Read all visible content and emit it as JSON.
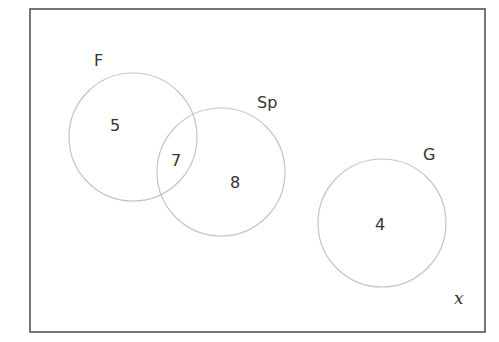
{
  "diagram": {
    "type": "venn",
    "universe": {
      "label": "x",
      "rect": {
        "x": 30,
        "y": 9,
        "width": 455,
        "height": 323
      },
      "label_pos": {
        "x": 454,
        "y": 304
      }
    },
    "sets": [
      {
        "id": "F",
        "label": "F",
        "circle": {
          "cx": 133,
          "cy": 137,
          "r": 64
        },
        "label_pos": {
          "x": 94,
          "y": 66
        }
      },
      {
        "id": "Sp",
        "label": "Sp",
        "circle": {
          "cx": 221,
          "cy": 172,
          "r": 64
        },
        "label_pos": {
          "x": 257,
          "y": 108
        }
      },
      {
        "id": "G",
        "label": "G",
        "circle": {
          "cx": 382,
          "cy": 223,
          "r": 64
        },
        "label_pos": {
          "x": 423,
          "y": 160
        }
      }
    ],
    "regions": [
      {
        "id": "F-only",
        "sets": [
          "F"
        ],
        "count": "5",
        "pos": {
          "x": 110,
          "y": 131
        }
      },
      {
        "id": "F-and-Sp",
        "sets": [
          "F",
          "Sp"
        ],
        "count": "7",
        "pos": {
          "x": 171,
          "y": 166
        }
      },
      {
        "id": "Sp-only",
        "sets": [
          "Sp"
        ],
        "count": "8",
        "pos": {
          "x": 230,
          "y": 188
        }
      },
      {
        "id": "G-only",
        "sets": [
          "G"
        ],
        "count": "4",
        "pos": {
          "x": 375,
          "y": 230
        }
      }
    ]
  },
  "colors": {
    "border": "#555555",
    "circle_stroke": "#c4c4c4",
    "text": "#333333",
    "background": "#ffffff"
  }
}
